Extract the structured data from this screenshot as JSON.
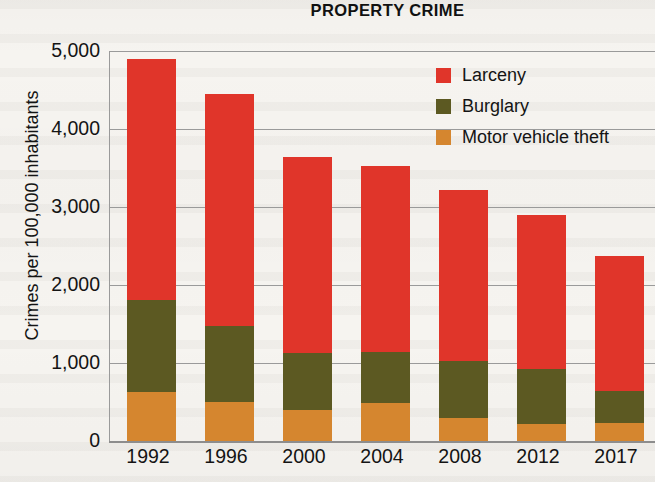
{
  "chart_data": {
    "type": "bar",
    "subtype": "stacked-bar",
    "title": "PROPERTY CRIME",
    "xlabel": "",
    "ylabel": "Crimes per 100,000 inhabitants",
    "categories": [
      "1992",
      "1996",
      "2000",
      "2004",
      "2008",
      "2012",
      "2017"
    ],
    "series": [
      {
        "name": "Larceny",
        "color": "#e0352a",
        "values": [
          3090,
          2975,
          2510,
          2385,
          2185,
          1975,
          1730
        ]
      },
      {
        "name": "Burglary",
        "color": "#5c5922",
        "values": [
          1185,
          975,
          735,
          650,
          735,
          705,
          410
        ]
      },
      {
        "name": "Motor vehicle theft",
        "color": "#d5862f",
        "values": [
          625,
          500,
          395,
          490,
          295,
          215,
          230
        ]
      }
    ],
    "totals": [
      4900,
      4450,
      3640,
      3525,
      3215,
      2895,
      2370
    ],
    "ylim": [
      0,
      5000
    ],
    "yticks": [
      0,
      1000,
      2000,
      3000,
      4000,
      5000
    ],
    "ytick_labels": [
      "0",
      "1,000",
      "2,000",
      "3,000",
      "4,000",
      "5,000"
    ],
    "grid": true,
    "legend_position": "top-right",
    "stack_order_bottom_to_top": [
      "Motor vehicle theft",
      "Burglary",
      "Larceny"
    ]
  },
  "legend": {
    "items": [
      {
        "label": "Larceny",
        "color": "#e0352a"
      },
      {
        "label": "Burglary",
        "color": "#5c5922"
      },
      {
        "label": "Motor vehicle theft",
        "color": "#d5862f"
      }
    ]
  }
}
